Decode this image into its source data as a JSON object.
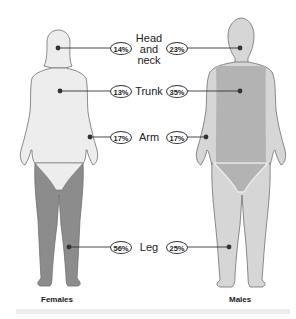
{
  "colors": {
    "female_body": "#ededed",
    "female_leg": "#8c8c8c",
    "male_light": "#d6d6d6",
    "male_dark": "#b3b3b3",
    "outline": "#6f6f6f",
    "dot": "#333333",
    "line": "#333333"
  },
  "regions": [
    {
      "name": "Head and neck",
      "label_lines": [
        "Head",
        "and",
        "neck"
      ],
      "female": "14%",
      "male": "23%"
    },
    {
      "name": "Trunk",
      "label_lines": [
        "Trunk"
      ],
      "female": "13%",
      "male": "35%"
    },
    {
      "name": "Arm",
      "label_lines": [
        "Arm"
      ],
      "female": "17%",
      "male": "17%"
    },
    {
      "name": "Leg",
      "label_lines": [
        "Leg"
      ],
      "female": "56%",
      "male": "25%"
    }
  ],
  "captions": {
    "female": "Females",
    "male": "Males"
  }
}
